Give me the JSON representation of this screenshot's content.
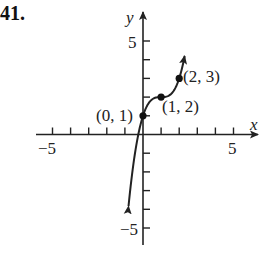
{
  "problem": {
    "number": "41."
  },
  "chart_data": {
    "type": "line",
    "title": "",
    "xlabel": "x",
    "ylabel": "y",
    "xlim": [
      -5.5,
      6.5
    ],
    "ylim": [
      -6,
      6
    ],
    "x_tick_labels": [
      "-5",
      "5"
    ],
    "y_tick_labels": [
      "5",
      "-5"
    ],
    "x_ticks": [
      -5,
      -4,
      -3,
      -2,
      -1,
      1,
      2,
      3,
      4,
      5
    ],
    "y_ticks": [
      -5,
      -4,
      -3,
      -2,
      -1,
      1,
      2,
      3,
      4,
      5
    ],
    "grid": false,
    "series": [
      {
        "name": "f(x) = (x-1)^3 + 2",
        "x": [
          -0.8,
          -0.5,
          0,
          0.5,
          1,
          1.5,
          2,
          2.3
        ],
        "y": [
          -3.832,
          -1.375,
          1,
          1.875,
          2,
          2.125,
          3,
          4.197
        ],
        "arrows": "both"
      }
    ],
    "points": [
      {
        "x": 0,
        "y": 1,
        "label": "(0, 1)"
      },
      {
        "x": 1,
        "y": 2,
        "label": "(1, 2)"
      },
      {
        "x": 2,
        "y": 3,
        "label": "(2, 3)"
      }
    ]
  },
  "labels": {
    "x_axis": "x",
    "y_axis": "y",
    "x_neg5": "−5",
    "x_pos5": "5",
    "y_pos5": "5",
    "y_neg5": "−5",
    "p0": "(0, 1)",
    "p1": "(1, 2)",
    "p2": "(2, 3)"
  }
}
